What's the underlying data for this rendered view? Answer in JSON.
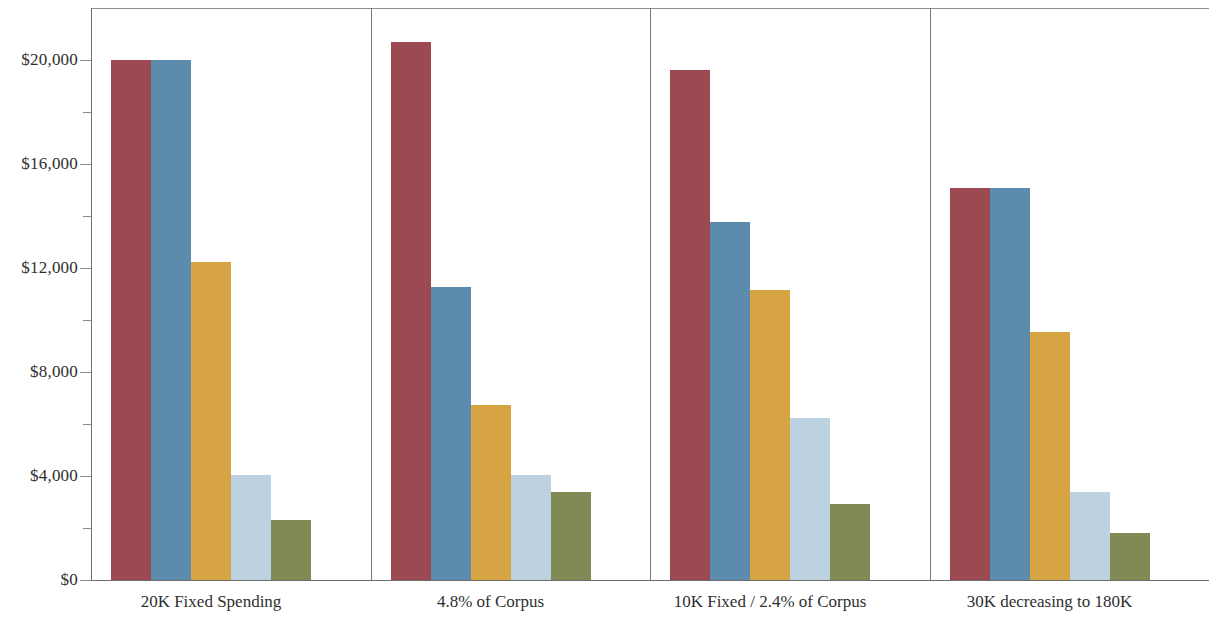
{
  "chart_data": {
    "type": "bar",
    "title": "",
    "subtitle": "",
    "xlabel": "",
    "ylabel": "",
    "ylim": [
      0,
      22000
    ],
    "grid": false,
    "legend_position": "none",
    "yticks": [
      0,
      4000,
      8000,
      12000,
      16000,
      20000
    ],
    "ytick_labels": [
      "$0",
      "$4,000",
      "$8,000",
      "$12,000",
      "$16,000",
      "$20,000"
    ],
    "yticks_minor": [
      2000,
      6000,
      10000,
      14000,
      18000
    ],
    "categories": [
      "20K Fixed Spending",
      "4.8% of Corpus",
      "10K Fixed / 2.4% of Corpus",
      "30K decreasing to 180K"
    ],
    "series": [
      {
        "name": "series-1",
        "color": "#9c4a51",
        "values": [
          20000,
          20690,
          19620,
          15080
        ]
      },
      {
        "name": "series-2",
        "color": "#5d8bae",
        "values": [
          20000,
          11270,
          13770,
          15080
        ]
      },
      {
        "name": "series-3",
        "color": "#d6a442",
        "values": [
          12250,
          6730,
          11150,
          9540
        ]
      },
      {
        "name": "series-4",
        "color": "#bdd2e0",
        "values": [
          4040,
          4040,
          6230,
          3380
        ]
      },
      {
        "name": "series-5",
        "color": "#7f8a54",
        "values": [
          2310,
          3380,
          2920,
          1800
        ]
      }
    ]
  },
  "axis": {
    "baseline_label": "$0"
  }
}
